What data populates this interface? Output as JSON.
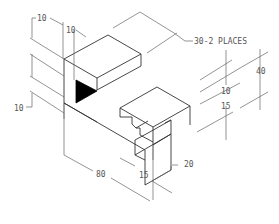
{
  "drawing": {
    "type": "isometric mechanical drawing",
    "subject": "notched block with triangular cut-out",
    "colors": {
      "background": "#ffffff",
      "lines": "#444444",
      "text": "#555555",
      "fill": "#000000"
    },
    "dimensions": {
      "top_left_width": "10",
      "top_left_depth": "10",
      "left_offset": "10",
      "slot_width_note": "30-2 PLACES",
      "height": "40",
      "slot_depth": "10",
      "slot_height": "15",
      "length": "80",
      "bottom_15": "15",
      "bottom_20": "20"
    }
  }
}
